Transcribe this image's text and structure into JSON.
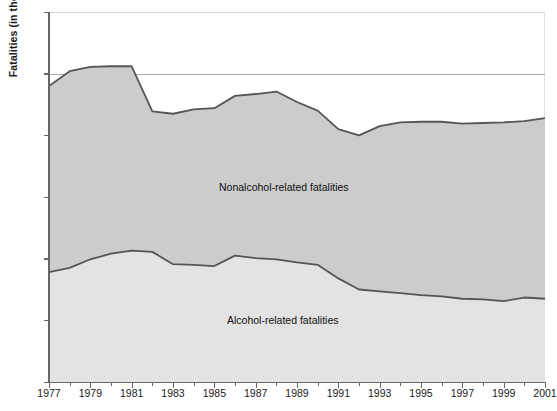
{
  "chart_data": {
    "type": "area",
    "title": "",
    "xlabel": "",
    "ylabel": "Fatalities (in thousands)",
    "stacked": true,
    "grid": true,
    "legend_position": "inline-annotations",
    "xlim": [
      1977,
      2001
    ],
    "ylim": [
      0,
      60
    ],
    "ytick_labels": [
      "0",
      "10",
      "20",
      "30",
      "40",
      "50",
      "60"
    ],
    "ytick_values": [
      0,
      10,
      20,
      30,
      40,
      50,
      60
    ],
    "xtick_labels": [
      "1977",
      "1979",
      "1981",
      "1983",
      "1985",
      "1987",
      "1989",
      "1991",
      "1993",
      "1995",
      "1997",
      "1999",
      "2001"
    ],
    "xtick_values": [
      1977,
      1979,
      1981,
      1983,
      1985,
      1987,
      1989,
      1991,
      1993,
      1995,
      1997,
      1999,
      2001
    ],
    "x": [
      1977,
      1978,
      1979,
      1980,
      1981,
      1982,
      1983,
      1984,
      1985,
      1986,
      1987,
      1988,
      1989,
      1990,
      1991,
      1992,
      1993,
      1994,
      1995,
      1996,
      1997,
      1998,
      1999,
      2000,
      2001
    ],
    "series": [
      {
        "name": "Alcohol-related fatalities",
        "color": "#e3e3e3",
        "line_color": "#555555",
        "values": [
          17.8,
          18.5,
          19.9,
          20.8,
          21.3,
          21.1,
          19.1,
          19.0,
          18.8,
          20.5,
          20.1,
          19.9,
          19.4,
          19.0,
          16.8,
          15.0,
          14.7,
          14.4,
          14.1,
          13.9,
          13.5,
          13.4,
          13.1,
          13.7,
          13.5
        ]
      },
      {
        "name": "Nonalcohol-related fatalities",
        "color": "#cccccc",
        "line_color": "#555555",
        "values": [
          30.2,
          31.9,
          30.8,
          30.4,
          29.9,
          22.8,
          24.4,
          25.2,
          25.6,
          25.9,
          26.6,
          27.2,
          26.0,
          25.0,
          24.2,
          25.0,
          26.8,
          27.7,
          28.1,
          28.3,
          28.4,
          28.6,
          29.0,
          28.6,
          29.3
        ]
      }
    ],
    "cumulative_totals": [
      48.0,
      50.4,
      51.1,
      51.2,
      51.2,
      43.9,
      43.5,
      44.2,
      44.4,
      46.4,
      46.7,
      47.1,
      45.4,
      44.0,
      41.0,
      40.0,
      41.5,
      42.1,
      42.2,
      42.2,
      41.9,
      42.0,
      42.1,
      42.3,
      42.8
    ],
    "annotations": [
      {
        "id": "nonalcohol",
        "text": "Nonalcohol-related fatalities"
      },
      {
        "id": "alcohol",
        "text": "Alcohol-related fatalities"
      }
    ]
  }
}
